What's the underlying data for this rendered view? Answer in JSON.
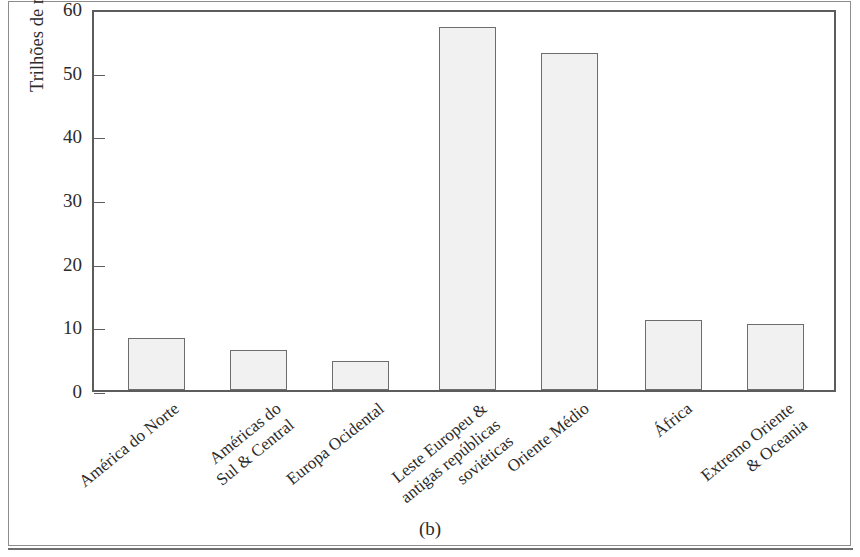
{
  "figure": {
    "caption": "(b)"
  },
  "chart_data": {
    "type": "bar",
    "title": "",
    "xlabel": "",
    "ylabel": "Trilhões de metros cúbicos",
    "ylim": [
      0,
      60
    ],
    "yticks": [
      0,
      10,
      20,
      30,
      40,
      50,
      60
    ],
    "ytick_labels": [
      "0",
      "10",
      "20",
      "30",
      "40",
      "50",
      "60"
    ],
    "grid": false,
    "legend": null,
    "categories": [
      "América do Norte",
      "Américas do Sul & Central",
      "Europa Ocidental",
      "Leste Europeu & antigas repúblicas soviéticas",
      "Oriente Médio",
      "África",
      "Extremo Oriente & Oceania"
    ],
    "category_lines": [
      [
        "América do Norte"
      ],
      [
        "Américas do",
        "Sul & Central"
      ],
      [
        "Europa Ocidental"
      ],
      [
        "Leste Europeu &",
        "antigas repúblicas",
        "soviéticas"
      ],
      [
        "Oriente Médio"
      ],
      [
        "África"
      ],
      [
        "Extremo Oriente",
        "& Oceania"
      ]
    ],
    "values": [
      8.2,
      6.3,
      4.6,
      57.0,
      52.9,
      11.0,
      10.4
    ],
    "bar_fill": "#f1f1f1",
    "bar_edge": "#6d6d6d",
    "axis_color": "#5c5c5c"
  }
}
